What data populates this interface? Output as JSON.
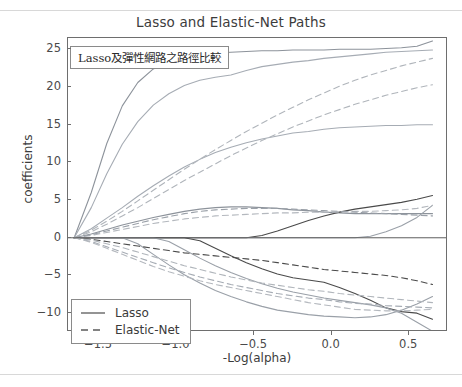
{
  "page": {
    "has_top_rule": true,
    "has_bottom_rule": true
  },
  "annotation": {
    "text": "Lasso及彈性網路之路徑比較"
  },
  "legend": {
    "position": "lower-left",
    "entries": [
      {
        "label": "Lasso",
        "style": "solid",
        "icon": "solid-line-icon"
      },
      {
        "label": "Elastic-Net",
        "style": "dashed",
        "icon": "dashed-line-icon"
      }
    ]
  },
  "chart_data": {
    "type": "line",
    "title": "Lasso and Elastic-Net Paths",
    "xlabel": "-Log(alpha)",
    "ylabel": "coefficients",
    "xlim": [
      -1.7,
      0.75
    ],
    "ylim": [
      -12.5,
      26.5
    ],
    "xticks": [
      -1.5,
      -1.0,
      -0.5,
      0.0,
      0.5
    ],
    "xtick_labels": [
      "−1.5",
      "−1.0",
      "−0.5",
      "0.0",
      "0.5"
    ],
    "yticks": [
      25,
      20,
      15,
      10,
      5,
      0,
      -5,
      -10
    ],
    "ytick_labels": [
      "25",
      "20",
      "15",
      "10",
      "5",
      "0",
      "−5",
      "−10"
    ],
    "grid": false,
    "colors": {
      "lasso": "#9aa0a8",
      "elastic_net": "#b4b8be",
      "axis": "#6e6e6e",
      "text": "#3c3c3c"
    },
    "x": [
      -1.66,
      -1.55,
      -1.45,
      -1.35,
      -1.25,
      -1.15,
      -1.05,
      -0.95,
      -0.85,
      -0.75,
      -0.65,
      -0.55,
      -0.45,
      -0.35,
      -0.25,
      -0.15,
      -0.05,
      0.05,
      0.15,
      0.25,
      0.35,
      0.45,
      0.55,
      0.65
    ],
    "series": [
      {
        "name": "Lasso coef 1",
        "style": "solid",
        "color": "#8d939b",
        "values": [
          0,
          6.0,
          12.5,
          17.5,
          20.6,
          22.4,
          23.4,
          24.0,
          24.3,
          24.5,
          24.6,
          24.7,
          24.8,
          24.8,
          24.9,
          24.9,
          24.9,
          25.0,
          25.0,
          25.0,
          25.1,
          25.2,
          25.4,
          26.1
        ]
      },
      {
        "name": "Lasso coef 2",
        "style": "solid",
        "color": "#a6acb4",
        "values": [
          0,
          4.0,
          8.5,
          12.4,
          15.4,
          17.6,
          19.1,
          20.2,
          20.9,
          21.3,
          21.6,
          22.2,
          22.7,
          23.0,
          23.3,
          23.5,
          23.8,
          24.0,
          24.2,
          24.4,
          24.6,
          24.7,
          24.8,
          24.9
        ]
      },
      {
        "name": "Lasso coef 3",
        "style": "solid",
        "color": "#a6acb4",
        "values": [
          0,
          1.2,
          2.6,
          4.0,
          5.5,
          6.9,
          8.2,
          9.4,
          10.4,
          11.3,
          12.0,
          12.6,
          13.1,
          13.5,
          13.9,
          14.1,
          14.4,
          14.6,
          14.7,
          14.8,
          14.9,
          14.9,
          15.0,
          15.0
        ]
      },
      {
        "name": "Lasso coef 4",
        "style": "solid",
        "color": "#8d939b",
        "values": [
          0,
          0.5,
          1.1,
          1.7,
          2.2,
          2.7,
          3.1,
          3.5,
          3.8,
          4.0,
          4.1,
          4.1,
          4.0,
          3.9,
          3.7,
          3.6,
          3.4,
          3.3,
          3.2,
          3.2,
          3.2,
          3.2,
          3.2,
          3.2
        ]
      },
      {
        "name": "Lasso coef 5",
        "style": "solid",
        "color": "#4a4a4a",
        "values": [
          0,
          0,
          0,
          0,
          0,
          0,
          0,
          0,
          0,
          0,
          0,
          0,
          0.3,
          0.9,
          1.6,
          2.3,
          2.9,
          3.4,
          3.8,
          4.1,
          4.4,
          4.7,
          5.1,
          5.6
        ]
      },
      {
        "name": "Lasso coef 6",
        "style": "solid",
        "color": "#9aa0a8",
        "values": [
          0,
          0,
          0,
          0,
          0,
          0,
          0,
          0,
          0,
          0,
          0,
          0,
          0,
          0,
          0,
          0,
          0,
          0,
          0,
          0.2,
          0.8,
          1.6,
          2.7,
          4.3
        ]
      },
      {
        "name": "Lasso coef 7",
        "style": "solid",
        "color": "#4a4a4a",
        "values": [
          0,
          0,
          0,
          0,
          0,
          0,
          0,
          0,
          -0.4,
          -1.4,
          -2.4,
          -3.3,
          -4.1,
          -4.8,
          -5.3,
          -5.6,
          -5.9,
          -6.6,
          -7.4,
          -8.3,
          -9.3,
          -9.8,
          -10.0,
          -10.8
        ]
      },
      {
        "name": "Lasso coef 8",
        "style": "solid",
        "color": "#9aa0a8",
        "values": [
          0,
          0,
          0,
          0,
          -0.8,
          -2.2,
          -3.6,
          -4.9,
          -6.0,
          -7.0,
          -7.8,
          -8.5,
          -9.1,
          -9.6,
          -9.9,
          -10.2,
          -10.4,
          -10.5,
          -10.6,
          -10.5,
          -10.2,
          -9.6,
          -8.8,
          -7.8
        ]
      },
      {
        "name": "Lasso coef 9",
        "style": "solid",
        "color": "#9aa0a8",
        "values": [
          0,
          0,
          0,
          0,
          0,
          0,
          -0.5,
          -1.6,
          -2.7,
          -3.7,
          -4.6,
          -5.4,
          -6.1,
          -6.7,
          -7.2,
          -7.6,
          -8.0,
          -8.3,
          -8.6,
          -8.9,
          -9.3,
          -10.0,
          -11.2,
          -12.4
        ]
      },
      {
        "name": "Elastic-Net coef 1",
        "style": "dashed",
        "color": "#b0b5bb",
        "values": [
          0,
          1.0,
          2.2,
          3.5,
          4.9,
          6.3,
          7.7,
          9.1,
          10.4,
          11.7,
          12.9,
          14.1,
          15.2,
          16.3,
          17.3,
          18.3,
          19.2,
          20.1,
          20.9,
          21.6,
          22.2,
          22.8,
          23.3,
          23.8
        ]
      },
      {
        "name": "Elastic-Net coef 2",
        "style": "dashed",
        "color": "#b0b5bb",
        "values": [
          0,
          0.8,
          1.8,
          2.9,
          4.0,
          5.2,
          6.4,
          7.6,
          8.7,
          9.8,
          10.9,
          11.9,
          12.9,
          13.8,
          14.7,
          15.5,
          16.3,
          17.0,
          17.7,
          18.3,
          18.9,
          19.4,
          19.9,
          20.3
        ]
      },
      {
        "name": "Elastic-Net coef 3",
        "style": "dashed",
        "color": "#b4b8be",
        "values": [
          0,
          0.3,
          0.7,
          1.1,
          1.5,
          1.9,
          2.2,
          2.5,
          2.7,
          2.9,
          3.0,
          3.1,
          3.2,
          3.3,
          3.3,
          3.4,
          3.4,
          3.4,
          3.5,
          3.5,
          3.6,
          3.7,
          3.9,
          4.3
        ]
      },
      {
        "name": "Elastic-Net coef 4",
        "style": "dashed",
        "color": "#9aa0a8",
        "values": [
          0,
          0.4,
          0.9,
          1.4,
          1.9,
          2.4,
          2.8,
          3.2,
          3.5,
          3.7,
          3.8,
          3.9,
          3.9,
          3.9,
          3.8,
          3.7,
          3.6,
          3.5,
          3.4,
          3.3,
          3.2,
          3.1,
          3.0,
          2.9
        ]
      },
      {
        "name": "Elastic-Net coef 5",
        "style": "dashed",
        "color": "#4a4a4a",
        "values": [
          0,
          -0.2,
          -0.5,
          -0.8,
          -1.1,
          -1.4,
          -1.7,
          -2.0,
          -2.2,
          -2.4,
          -2.6,
          -2.8,
          -3.0,
          -3.3,
          -3.6,
          -3.9,
          -4.2,
          -4.4,
          -4.6,
          -4.8,
          -5.0,
          -5.3,
          -5.7,
          -6.2
        ]
      },
      {
        "name": "Elastic-Net coef 6",
        "style": "dashed",
        "color": "#a6acb4",
        "values": [
          0,
          -0.5,
          -1.2,
          -1.9,
          -2.6,
          -3.3,
          -4.0,
          -4.6,
          -5.2,
          -5.7,
          -6.2,
          -6.6,
          -7.0,
          -7.4,
          -7.7,
          -8.0,
          -8.2,
          -8.5,
          -8.7,
          -8.8,
          -9.0,
          -9.1,
          -9.2,
          -9.3
        ]
      },
      {
        "name": "Elastic-Net coef 7",
        "style": "dashed",
        "color": "#b0b5bb",
        "values": [
          0,
          -0.3,
          -0.8,
          -1.3,
          -1.9,
          -2.5,
          -3.1,
          -3.7,
          -4.2,
          -4.7,
          -5.2,
          -5.6,
          -6.0,
          -6.3,
          -6.6,
          -6.9,
          -7.1,
          -7.4,
          -7.6,
          -7.8,
          -8.0,
          -8.2,
          -8.4,
          -8.6
        ]
      },
      {
        "name": "Elastic-Net coef 8",
        "style": "dashed",
        "color": "#b4b8be",
        "values": [
          0,
          -0.6,
          -1.4,
          -2.2,
          -3.0,
          -3.8,
          -4.5,
          -5.1,
          -5.7,
          -6.2,
          -6.6,
          -7.0,
          -7.4,
          -7.8,
          -8.2,
          -8.6,
          -8.9,
          -9.2,
          -9.5,
          -9.6,
          -9.7,
          -9.7,
          -9.6,
          -9.5
        ]
      }
    ]
  }
}
